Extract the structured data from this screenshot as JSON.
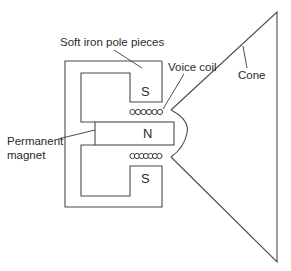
{
  "diagram": {
    "labels": {
      "pole_pieces": "Soft iron pole pieces",
      "voice_coil": "Voice coil",
      "cone": "Cone",
      "magnet_line1": "Permanent",
      "magnet_line2": "magnet"
    },
    "poles": {
      "top": "S",
      "middle": "N",
      "bottom": "S"
    },
    "colors": {
      "line": "#4a4a4a",
      "text": "#2a2a2a",
      "background": "#ffffff"
    },
    "voice_coil": {
      "top_turns": 6,
      "bottom_turns": 7
    }
  }
}
